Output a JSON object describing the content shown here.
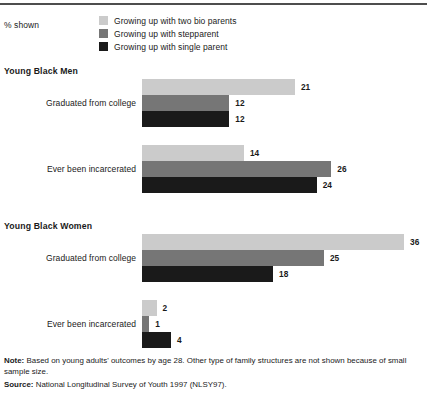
{
  "header": {
    "pct_shown_label": "% shown"
  },
  "legend": {
    "items": [
      {
        "label": "Growing up with two bio parents",
        "color": "#cbcbcb",
        "icon": "legend-swatch-icon"
      },
      {
        "label": "Growing up with stepparent",
        "color": "#767676",
        "icon": "legend-swatch-icon"
      },
      {
        "label": "Growing up with single parent",
        "color": "#1a1a1a",
        "icon": "legend-swatch-icon"
      }
    ]
  },
  "footer": {
    "note_label": "Note:",
    "note_text": " Based on young adults' outcomes by age 28. Other type of family structures are not shown because of small sample size.",
    "source_label": "Source:",
    "source_text": " National Longitudinal Survey of Youth 1997 (NLSY97)."
  },
  "sections": [
    {
      "title": "Young Black Men",
      "groups": [
        {
          "label": "Graduated from college",
          "values": [
            21,
            12,
            12
          ],
          "value_labels": [
            "21",
            "12",
            "12"
          ]
        },
        {
          "label": "Ever been incarcerated",
          "values": [
            14,
            26,
            24
          ],
          "value_labels": [
            "14",
            "26",
            "24"
          ]
        }
      ]
    },
    {
      "title": "Young Black Women",
      "groups": [
        {
          "label": "Graduated from college",
          "values": [
            36,
            25,
            18
          ],
          "value_labels": [
            "36",
            "25",
            "18"
          ]
        },
        {
          "label": "Ever been incarcerated",
          "values": [
            2,
            1,
            4
          ],
          "value_labels": [
            "2",
            "1",
            "4"
          ]
        }
      ]
    }
  ],
  "chart_data": {
    "type": "bar",
    "orientation": "horizontal",
    "title": "",
    "xlabel": "",
    "ylabel": "",
    "unit": "% shown",
    "grid": false,
    "legend_position": "top",
    "xlim": [
      0,
      36
    ],
    "px_per_unit": 7.28,
    "series": [
      {
        "name": "Growing up with two bio parents",
        "color": "#cbcbcb",
        "values": [
          21,
          14,
          36,
          2
        ]
      },
      {
        "name": "Growing up with stepparent",
        "color": "#767676",
        "values": [
          12,
          26,
          25,
          1
        ]
      },
      {
        "name": "Growing up with single parent",
        "color": "#1a1a1a",
        "values": [
          12,
          24,
          18,
          4
        ]
      }
    ],
    "categories": [
      "Young Black Men - Graduated from college",
      "Young Black Men - Ever been incarcerated",
      "Young Black Women - Graduated from college",
      "Young Black Women - Ever been incarcerated"
    ],
    "annotations": [
      "Note: Based on young adults' outcomes by age 28. Other type of family structures are not shown because of small sample size.",
      "Source: National Longitudinal Survey of Youth 1997 (NLSY97)."
    ]
  }
}
